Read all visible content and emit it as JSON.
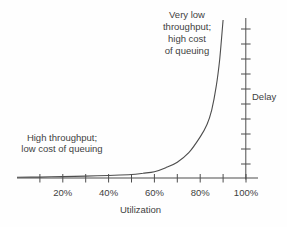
{
  "colors": {
    "background": "#fefefe",
    "axis": "#4d4d4d",
    "curve": "#4d4d4d",
    "text": "#3f3f3f"
  },
  "chart_data": {
    "type": "line",
    "title": "",
    "xlabel": "Utilization",
    "ylabel": "Delay",
    "x_axis": {
      "range_percent": [
        0,
        100
      ],
      "tick_step_percent": 10,
      "labeled_ticks": [
        "20%",
        "40%",
        "60%",
        "80%",
        "100%"
      ]
    },
    "y_axis": {
      "side": "right",
      "tick_count": 10,
      "labels_shown": false
    },
    "grid": false,
    "legend": false,
    "series": [
      {
        "name": "queuing-delay-curve",
        "x_utilization_percent": [
          0,
          10,
          20,
          30,
          40,
          50,
          55,
          60,
          65,
          70,
          75,
          80,
          83,
          85,
          87,
          88.5,
          90
        ],
        "y_relative_delay": [
          0.5,
          0.6,
          0.9,
          1.2,
          1.6,
          2.2,
          3,
          4,
          6.5,
          10,
          16,
          26,
          34,
          43,
          58,
          75,
          100
        ]
      }
    ],
    "annotations": [
      {
        "id": "high-cost",
        "text": "Very low throughput; high cost of queuing",
        "lines": [
          "Very low",
          "throughput;",
          "high cost",
          "of queuing"
        ],
        "position": "top-center"
      },
      {
        "id": "low-cost",
        "text": "High throughput; low cost of queuing",
        "lines": [
          "High throughput;",
          "low cost of queuing"
        ],
        "position": "middle-left"
      }
    ]
  }
}
